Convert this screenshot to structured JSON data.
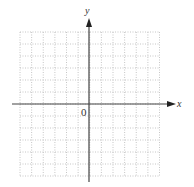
{
  "diagram": {
    "type": "coordinate-grid",
    "x_axis_label": "x",
    "y_axis_label": "y",
    "origin_label": "0",
    "grid": {
      "columns": 12,
      "rows": 12,
      "line_style": "dotted",
      "line_color": "#b8b8b8"
    },
    "axis_color": "#444444"
  }
}
